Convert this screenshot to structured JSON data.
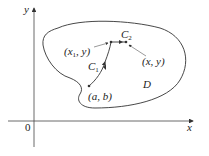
{
  "diagram": {
    "axes": {
      "x_label": "x",
      "y_label": "y",
      "origin_label": "0"
    },
    "region": {
      "label": "D"
    },
    "curves": [
      {
        "name": "C",
        "subscript": "1"
      },
      {
        "name": "C",
        "subscript": "2"
      }
    ],
    "points": [
      {
        "label": "(a, b)"
      },
      {
        "label_prefix": "(x",
        "subscript": "1",
        "label_suffix": ", y)"
      },
      {
        "label": "(x, y)"
      }
    ]
  }
}
